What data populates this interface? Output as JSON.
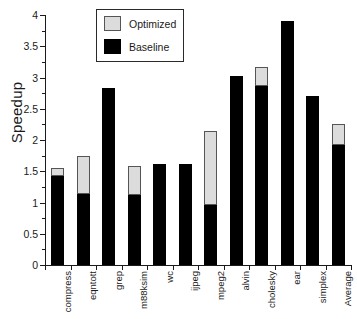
{
  "chart_data": {
    "type": "bar",
    "title": "",
    "subtitle": "",
    "xlabel": "",
    "ylabel": "Speedup",
    "ylim": [
      0,
      4
    ],
    "ytick_step": 0.5,
    "ytick_labels": [
      "0",
      "0.5",
      "1",
      "1.5",
      "2",
      "2.5",
      "3",
      "3.5",
      "4"
    ],
    "ytick_values": [
      0,
      0.5,
      1,
      1.5,
      2,
      2.5,
      3,
      3.5,
      4
    ],
    "grid": false,
    "stacked": true,
    "legend_position": "top-center",
    "legend_entries": [
      {
        "name": "Optimized",
        "color": "#dcdcdc"
      },
      {
        "name": "Baseline",
        "color": "#000000"
      }
    ],
    "categories": [
      "compress",
      "eqntott",
      "grep",
      "m88ksim",
      "wc",
      "ijpeg",
      "mpeg2",
      "alvin",
      "cholesky",
      "ear",
      "simplex",
      "Average"
    ],
    "series": [
      {
        "name": "Baseline",
        "color": "#000000",
        "values": [
          1.42,
          1.13,
          2.84,
          1.12,
          1.61,
          1.61,
          0.96,
          3.02,
          2.87,
          3.9,
          2.7,
          1.92
        ]
      },
      {
        "name": "Optimized",
        "color": "#dcdcdc",
        "note": "totals at top of each stacked bar",
        "values": [
          1.56,
          1.75,
          2.84,
          1.58,
          1.61,
          1.61,
          2.14,
          3.02,
          3.17,
          3.9,
          2.7,
          2.25
        ]
      }
    ]
  },
  "legend": {
    "optimized_label": "Optimized",
    "baseline_label": "Baseline"
  },
  "axes": {
    "y_title": "Speedup"
  }
}
